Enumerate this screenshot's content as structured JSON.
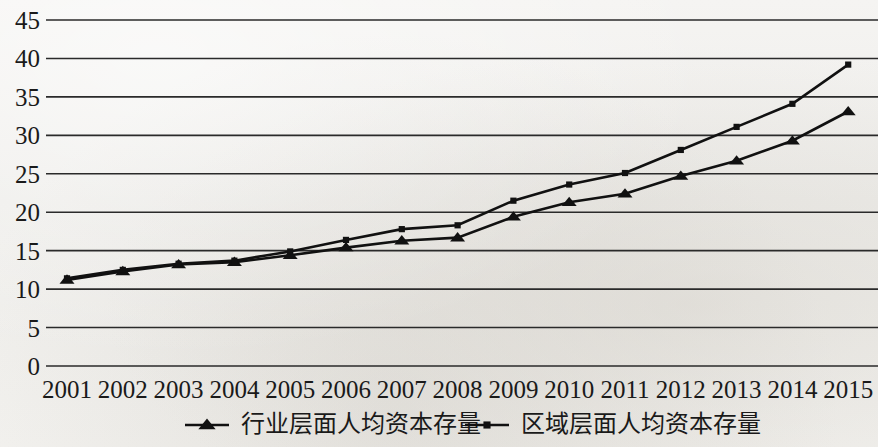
{
  "chart_data": {
    "type": "line",
    "title": "",
    "subtitle": "",
    "xlabel": "",
    "ylabel": "",
    "categories": [
      "2001",
      "2002",
      "2003",
      "2004",
      "2005",
      "2006",
      "2007",
      "2008",
      "2009",
      "2010",
      "2011",
      "2012",
      "2013",
      "2014",
      "2015"
    ],
    "x_tick_labels": [
      "2001",
      "2002",
      "2003",
      "2004",
      "2005",
      "2006",
      "2007",
      "2008",
      "2009",
      "2010",
      "2011",
      "2012",
      "2013",
      "2014",
      "2015"
    ],
    "y_tick_labels": [
      "0",
      "5",
      "10",
      "15",
      "20",
      "25",
      "30",
      "35",
      "40",
      "45"
    ],
    "y_ticks": [
      0,
      5,
      10,
      15,
      20,
      25,
      30,
      35,
      40,
      45
    ],
    "ylim": [
      0,
      45
    ],
    "grid": true,
    "legend_position": "bottom",
    "series": [
      {
        "name": "行业层面人均资本存量",
        "marker": "triangle",
        "color": "#111111",
        "values": [
          11.2,
          12.3,
          13.2,
          13.5,
          14.4,
          15.4,
          16.3,
          16.7,
          19.4,
          21.3,
          22.4,
          24.7,
          26.7,
          29.3,
          33.1
        ]
      },
      {
        "name": "区域层面人均资本存量",
        "marker": "square",
        "color": "#111111",
        "values": [
          11.4,
          12.5,
          13.3,
          13.7,
          14.9,
          16.4,
          17.8,
          18.3,
          21.5,
          23.6,
          25.1,
          28.1,
          31.1,
          34.1,
          39.2
        ]
      }
    ]
  },
  "legend": {
    "items": [
      {
        "label": "行业层面人均资本存量",
        "marker": "triangle"
      },
      {
        "label": "区域层面人均资本存量",
        "marker": "square"
      }
    ]
  }
}
